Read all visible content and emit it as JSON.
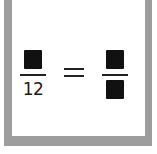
{
  "card": {
    "frame_color": "#9d9d9d",
    "equation": {
      "left_fraction": {
        "numerator": "",
        "denominator": "12",
        "numerator_blank": true
      },
      "operator": "=",
      "right_fraction": {
        "numerator": "",
        "denominator": "",
        "numerator_blank": true,
        "denominator_blank": true
      }
    }
  }
}
